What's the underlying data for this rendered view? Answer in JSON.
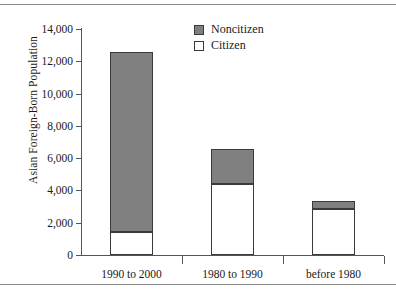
{
  "chart_data": {
    "type": "bar",
    "subtype": "stacked-vertical",
    "title": "",
    "xlabel": "",
    "ylabel": "Asian Foreign-Born Population",
    "categories": [
      "1990 to 2000",
      "1980 to 1990",
      "before 1980"
    ],
    "series": [
      {
        "name": "Citizen",
        "color": "#ffffff",
        "values": [
          1450,
          4400,
          2850
        ]
      },
      {
        "name": "Noncitizen",
        "color": "#808080",
        "values": [
          11100,
          2180,
          470
        ]
      }
    ],
    "totals": [
      12550,
      6580,
      3320
    ],
    "stack_order_bottom_to_top": [
      "Citizen",
      "Noncitizen"
    ],
    "ylim": [
      0,
      14000
    ],
    "yticks": [
      0,
      2000,
      4000,
      6000,
      8000,
      10000,
      12000,
      14000
    ],
    "ytick_labels": [
      "0",
      "2,000",
      "4,000",
      "6,000",
      "8,000",
      "10,000",
      "12,000",
      "14,000"
    ],
    "grid": false,
    "legend_position": "top-center",
    "legend_entries": [
      {
        "label": "Noncitizen",
        "swatch": "filled-gray"
      },
      {
        "label": "Citizen",
        "swatch": "outlined-white"
      }
    ]
  },
  "figure": {
    "background": "#ffffff",
    "rule_color": "#8a8a8a",
    "axis_color": "#555555",
    "bar_border_color": "#3a3a3a"
  }
}
